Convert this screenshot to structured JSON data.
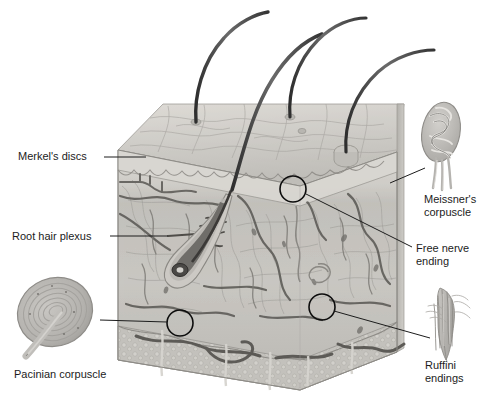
{
  "figure": {
    "background_color": "#ffffff",
    "width": 493,
    "height": 406,
    "style": "grayscale anatomical illustration"
  },
  "labels": {
    "merkel": {
      "text": "Merkel's discs",
      "x": 18,
      "y": 160,
      "anchor": "start",
      "leader": "M 104 157 L 146 157"
    },
    "root_hair_plexus": {
      "text": "Root hair plexus",
      "x": 12,
      "y": 240,
      "anchor": "start",
      "leader": "M 110 236 L 168 236"
    },
    "pacinian": {
      "text": "Pacinian corpuscle",
      "x": 14,
      "y": 378,
      "anchor": "start",
      "leader": "M 100 320 L 167 322"
    },
    "meissner": {
      "line1": "Meissner's",
      "line2": "corpuscle",
      "x": 424,
      "y": 203,
      "anchor": "start",
      "leader": "M 390 183 L 425 168"
    },
    "free_nerve": {
      "line1": "Free nerve",
      "line2": "ending",
      "x": 416,
      "y": 252,
      "anchor": "start",
      "leader": "M 306 194 L 412 247"
    },
    "ruffini": {
      "line1": "Ruffini",
      "line2": "endings",
      "x": 425,
      "y": 369,
      "anchor": "start",
      "leader": "M 334 311 L 430 338"
    }
  },
  "callouts": [
    {
      "name": "free-nerve-callout",
      "cx": 293,
      "cy": 189,
      "r": 13
    },
    {
      "name": "pacinian-callout",
      "cx": 180,
      "cy": 323,
      "r": 13
    },
    {
      "name": "ruffini-callout",
      "cx": 322,
      "cy": 307,
      "r": 13
    }
  ],
  "skin_block": {
    "epidermis_surface_color": "#cfcfcb",
    "epidermis_band_color": "#d7d7d3",
    "dermis_color": "#bdbdb9",
    "hypodermis_color": "#c6c6c2",
    "left_edge": 118,
    "right_edge": 397,
    "top": 104,
    "bottom": 390
  },
  "hairs": {
    "count": 4,
    "color": "#4a4a4a"
  },
  "insets": {
    "pacinian_corpuscle": {
      "name": "pacinian-corpuscle-inset",
      "cx": 55,
      "cy": 312
    },
    "meissner_corpuscle": {
      "name": "meissner-corpuscle-inset",
      "cx": 441,
      "cy": 135
    },
    "ruffini_endings": {
      "name": "ruffini-endings-inset",
      "cx": 447,
      "cy": 322
    }
  }
}
